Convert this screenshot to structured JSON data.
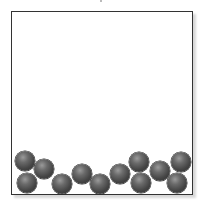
{
  "diagram": {
    "container": {
      "x": 11,
      "y": 11,
      "width": 180,
      "height": 182,
      "border_color": "#333333"
    },
    "ball_color": "#454545",
    "ball_radius": 10,
    "balls": [
      {
        "id": "A",
        "cx": 25,
        "cy": 161
      },
      {
        "id": "B",
        "cx": 27,
        "cy": 183
      },
      {
        "id": "C",
        "cx": 44,
        "cy": 169
      },
      {
        "id": "D",
        "cx": 62,
        "cy": 184
      },
      {
        "id": "E",
        "cx": 82,
        "cy": 174
      },
      {
        "id": "F",
        "cx": 100,
        "cy": 184
      },
      {
        "id": "G",
        "cx": 120,
        "cy": 174
      },
      {
        "id": "H",
        "cx": 139,
        "cy": 162
      },
      {
        "id": "I",
        "cx": 141,
        "cy": 183
      },
      {
        "id": "J",
        "cx": 160,
        "cy": 171
      },
      {
        "id": "K",
        "cx": 181,
        "cy": 162
      },
      {
        "id": "L",
        "cx": 177,
        "cy": 183
      }
    ]
  }
}
